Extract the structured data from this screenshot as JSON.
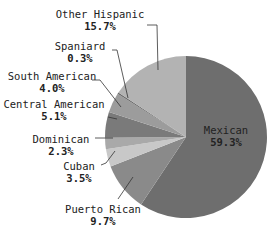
{
  "chart_data": {
    "type": "pie",
    "title": "",
    "categories": [
      "Mexican",
      "Puerto Rican",
      "Cuban",
      "Dominican",
      "Central American",
      "South American",
      "Spaniard",
      "Other Hispanic"
    ],
    "values": [
      59.3,
      9.7,
      3.5,
      2.3,
      5.1,
      4.0,
      0.3,
      15.7
    ],
    "labels": [
      "59.3%",
      "9.7%",
      "3.5%",
      "2.3%",
      "5.1%",
      "4.0%",
      "0.3%",
      "15.7%"
    ],
    "colors": [
      "#6e6e6e",
      "#8a8a8a",
      "#c8c8c8",
      "#a9a9a9",
      "#7a7a7a",
      "#9c9c9c",
      "#6a6a6a",
      "#b3b3b3"
    ],
    "start_angle": "12 o'clock",
    "direction": "clockwise",
    "legend": "none (callout labels)"
  },
  "labels": {
    "mexican": {
      "name": "Mexican",
      "pct": "59.3%"
    },
    "puerto_rican": {
      "name": "Puerto Rican",
      "pct": "9.7%"
    },
    "cuban": {
      "name": "Cuban",
      "pct": "3.5%"
    },
    "dominican": {
      "name": "Dominican",
      "pct": "2.3%"
    },
    "central_american": {
      "name": "Central American",
      "pct": "5.1%"
    },
    "south_american": {
      "name": "South American",
      "pct": "4.0%"
    },
    "spaniard": {
      "name": "Spaniard",
      "pct": "0.3%"
    },
    "other_hispanic": {
      "name": "Other Hispanic",
      "pct": "15.7%"
    }
  }
}
